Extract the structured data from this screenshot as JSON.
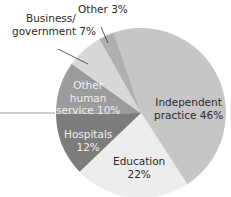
{
  "chart_data": {
    "type": "pie",
    "title": "",
    "start_angle_deg": -18.6,
    "direction": "clockwise",
    "center": [
      141,
      113
    ],
    "radius": 85,
    "slices": [
      {
        "label": "Independent practice",
        "value": 46,
        "color": "#c6c6c6",
        "text_lines": [
          "Independent",
          "practice 46%"
        ]
      },
      {
        "label": "Education",
        "value": 22,
        "color": "#ededed",
        "text_lines": [
          "Education",
          "22%"
        ]
      },
      {
        "label": "Hospitals",
        "value": 12,
        "color": "#7c7c7c",
        "text_lines": [
          "Hospitals",
          "12%"
        ]
      },
      {
        "label": "Other human service",
        "value": 10,
        "color": "#9c9c9c",
        "text_lines": [
          "Other",
          "human",
          "service 10%"
        ]
      },
      {
        "label": "Business/government",
        "value": 7,
        "color": "#d8d8d8",
        "text_lines": [
          "Business/",
          "government 7%"
        ]
      },
      {
        "label": "Other",
        "value": 3,
        "color": "#b0b0b0",
        "text_lines": [
          "Other 3%"
        ]
      }
    ],
    "units": "%"
  },
  "labels": {
    "independent": [
      "Independent",
      "practice 46%"
    ],
    "education": [
      "Education",
      "22%"
    ],
    "hospitals": [
      "Hospitals",
      "12%"
    ],
    "other_human": [
      "Other",
      "human",
      "service 10%"
    ],
    "business": [
      "Business/",
      "government 7%"
    ],
    "other": [
      "Other 3%"
    ]
  }
}
